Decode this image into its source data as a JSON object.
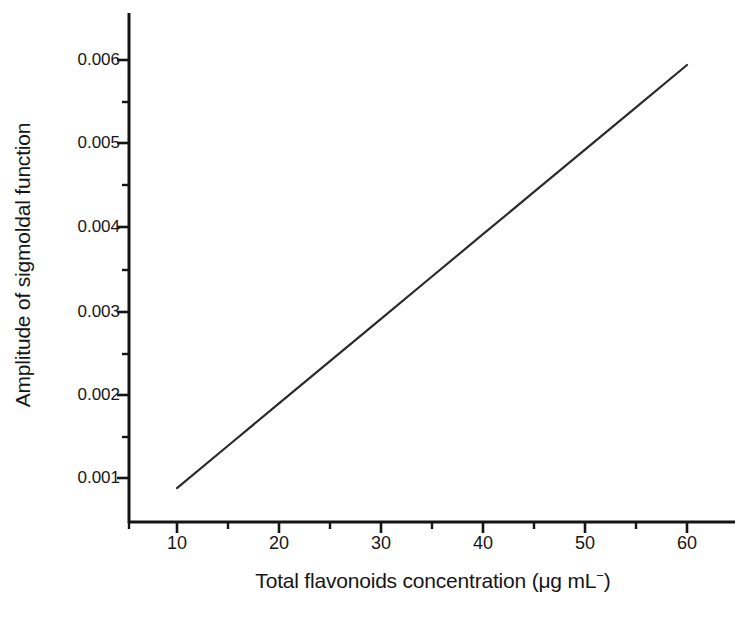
{
  "figure": {
    "background_color": "#ffffff",
    "line_color": "#2b2b2b",
    "axis_color": "#141414"
  },
  "axes": {
    "y_title": "Amplitude of sigmoldal function",
    "x_title_main": "Total flavonoids concentration (μg mL",
    "x_title_sup": "−",
    "x_title_close": ")",
    "x_title_full": "Total flavonoids concentration (μg mL⁻)",
    "y_ticks": [
      "0.001",
      "0.002",
      "0.003",
      "0.004",
      "0.005",
      "0.006"
    ],
    "x_ticks": [
      "10",
      "20",
      "30",
      "40",
      "50",
      "60"
    ]
  },
  "chart_data": {
    "type": "line",
    "title": "",
    "subtitle": "",
    "xlabel": "Total flavonoids concentration (μg mL⁻)",
    "ylabel": "Amplitude of sigmoldal function",
    "xlim": [
      4.1,
      63.5
    ],
    "ylim": [
      0.00036,
      0.00644
    ],
    "xticks": [
      10,
      20,
      30,
      40,
      50,
      60
    ],
    "yticks": [
      0.001,
      0.002,
      0.003,
      0.004,
      0.005,
      0.006
    ],
    "xtick_labels": [
      "10",
      "20",
      "30",
      "40",
      "50",
      "60"
    ],
    "ytick_labels": [
      "0.001",
      "0.002",
      "0.003",
      "0.004",
      "0.005",
      "0.006"
    ],
    "minor_ticks": true,
    "minor_xticks": [
      15,
      25,
      35,
      45,
      55
    ],
    "minor_yticks": [
      0.0015,
      0.0025,
      0.0035,
      0.0045,
      0.0055
    ],
    "grid": false,
    "legend": false,
    "legend_position": "none",
    "spines": [
      "left",
      "bottom"
    ],
    "series": [
      {
        "name": "calibration line",
        "style": "solid",
        "color": "#2b2b2b",
        "linewidth": 1.4,
        "markers": false,
        "x": [
          10,
          15,
          20,
          25,
          30,
          35,
          40,
          45,
          50,
          55,
          60
        ],
        "y": [
          0.00088,
          0.001386,
          0.001892,
          0.002398,
          0.002904,
          0.00341,
          0.003916,
          0.004422,
          0.004928,
          0.005434,
          0.00594
        ],
        "fit": {
          "equation": "y = 0.0001012x - 0.000132",
          "slope": 0.0001012,
          "intercept": -0.000132
        }
      }
    ]
  }
}
